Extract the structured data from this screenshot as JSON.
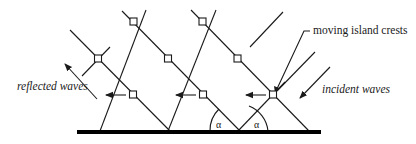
{
  "diagram": {
    "labels": {
      "reflected": "reflected waves",
      "incident": "incident waves",
      "crests": "moving island crests",
      "angle_left": "α",
      "angle_right": "α"
    },
    "colors": {
      "line": "#1a1a1a",
      "ground": "#000000",
      "background": "#ffffff"
    },
    "nodes": [
      {
        "row": "top",
        "x": 134,
        "y": 22
      },
      {
        "row": "top",
        "x": 203,
        "y": 22
      },
      {
        "row": "middle",
        "x": 98,
        "y": 59
      },
      {
        "row": "middle",
        "x": 168,
        "y": 59
      },
      {
        "row": "middle",
        "x": 238,
        "y": 59
      },
      {
        "row": "lower",
        "x": 133,
        "y": 95
      },
      {
        "row": "lower",
        "x": 203,
        "y": 95
      },
      {
        "row": "lower",
        "x": 273,
        "y": 95
      }
    ],
    "arrows": {
      "crest_motion_count": 3,
      "reflected_direction": "up-left",
      "incident_direction": "down-left"
    }
  }
}
